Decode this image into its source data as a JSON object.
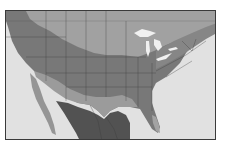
{
  "map": {
    "type": "choropleth",
    "region": "contiguous United States, southern Canada, northern Mexico",
    "labels": [],
    "colors": {
      "ocean": "#e8e8e8",
      "zone_light": "#a6a6a6",
      "zone_medium": "#7c7c7c",
      "zone_dark": "#555555",
      "zone_pale_south": "#9a9a9a",
      "lakes": "#f0f0f0",
      "borders": "#3c3c3c",
      "frame": "#3a3a3a"
    },
    "zones": [
      {
        "name": "northern-zone",
        "shade": "light"
      },
      {
        "name": "central-zone",
        "shade": "medium"
      },
      {
        "name": "southwest-band",
        "shade": "light"
      },
      {
        "name": "mexico-zone",
        "shade": "dark"
      },
      {
        "name": "florida-tip",
        "shade": "light"
      }
    ]
  }
}
